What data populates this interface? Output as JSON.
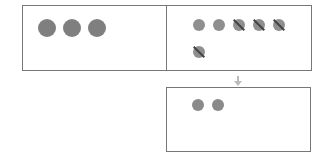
{
  "diagram": {
    "type": "subtraction-visual",
    "left_box": {
      "count": 3,
      "color": "#7f7f7f"
    },
    "right_box": {
      "total": 6,
      "crossed_out": 4,
      "color": "#8f8f8f"
    },
    "result_box": {
      "count": 2,
      "color": "#8a8a8a"
    },
    "arrow": "down-arrow-icon"
  }
}
